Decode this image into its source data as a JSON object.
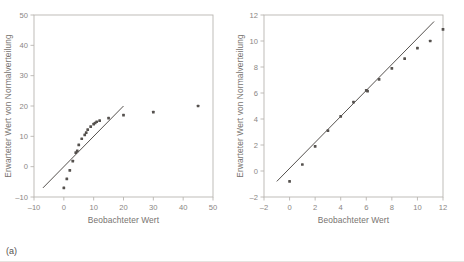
{
  "figure": {
    "captions": {
      "a": "(a)",
      "b": "(b)"
    },
    "colors": {
      "point": "#55514e",
      "line": "#55514e",
      "frame": "#b9b5b1",
      "tick_label": "#8a8683",
      "axis_title": "#77736f",
      "background": "#ffffff"
    }
  },
  "chart_data": [
    {
      "type": "scatter",
      "panel": "a",
      "title": "",
      "xlabel": "Beobachteter Wert",
      "ylabel": "Erwarteter Wert von Normalverteilung",
      "xlim": [
        -10,
        50
      ],
      "ylim": [
        -10,
        50
      ],
      "xticks": [
        -10,
        0,
        10,
        20,
        30,
        40,
        50
      ],
      "yticks": [
        -10,
        0,
        10,
        20,
        30,
        40,
        50
      ],
      "xtick_labels": [
        "-10",
        "0",
        "10",
        "20",
        "30",
        "40",
        "50"
      ],
      "ytick_labels": [
        "-10",
        "0",
        "10",
        "20",
        "30",
        "40",
        "50"
      ],
      "grid": false,
      "legend": "none",
      "x": [
        0,
        1,
        2,
        3,
        4,
        4.5,
        5,
        6,
        7,
        7.5,
        8,
        9,
        10,
        10.5,
        11,
        12,
        15,
        20,
        30,
        45
      ],
      "y": [
        -7,
        -4,
        -1.2,
        1.8,
        4.6,
        5.2,
        7.2,
        9.2,
        10.5,
        11.2,
        12.2,
        13.2,
        14.0,
        14.4,
        14.8,
        15.2,
        16.0,
        17.0,
        18.0,
        20.0
      ],
      "reference_line": {
        "x": [
          -7,
          20
        ],
        "y": [
          -7,
          20
        ],
        "label": ""
      }
    },
    {
      "type": "scatter",
      "panel": "b",
      "title": "",
      "xlabel": "Beobachteter Wert",
      "ylabel": "Erwarteter Wert von Normalverteilung",
      "xlim": [
        -2,
        12
      ],
      "ylim": [
        -2,
        12
      ],
      "xticks": [
        -2,
        0,
        2,
        4,
        6,
        8,
        10,
        12
      ],
      "yticks": [
        -2,
        0,
        2,
        4,
        6,
        8,
        10,
        12
      ],
      "xtick_labels": [
        "-2",
        "0",
        "2",
        "4",
        "6",
        "8",
        "10",
        "12"
      ],
      "ytick_labels": [
        "-2",
        "0",
        "2",
        "4",
        "6",
        "8",
        "10",
        "12"
      ],
      "grid": false,
      "legend": "none",
      "x": [
        0,
        1,
        2,
        3,
        4,
        5,
        6,
        6.1,
        7,
        8,
        9,
        10,
        11,
        12
      ],
      "y": [
        -0.8,
        0.5,
        1.9,
        3.1,
        4.2,
        5.3,
        6.2,
        6.15,
        7.05,
        7.9,
        8.65,
        9.45,
        10.0,
        10.9
      ],
      "reference_line": {
        "x": [
          -1.0,
          11.3
        ],
        "y": [
          -0.8,
          11.5
        ],
        "label": ""
      }
    }
  ]
}
